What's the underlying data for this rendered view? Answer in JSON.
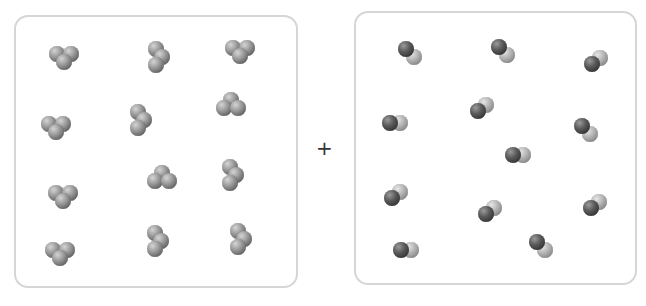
{
  "operator": "+",
  "left_box": {
    "label": "triatomic molecules (3 identical atoms)",
    "count": 12,
    "molecules": [
      {
        "x": 64,
        "y": 57,
        "shape": "v-down"
      },
      {
        "x": 158,
        "y": 57,
        "shape": "v-vertical"
      },
      {
        "x": 240,
        "y": 51,
        "shape": "v-down"
      },
      {
        "x": 56,
        "y": 127,
        "shape": "v-down"
      },
      {
        "x": 140,
        "y": 120,
        "shape": "v-vertical"
      },
      {
        "x": 231,
        "y": 105,
        "shape": "v-up"
      },
      {
        "x": 63,
        "y": 196,
        "shape": "v-down"
      },
      {
        "x": 162,
        "y": 178,
        "shape": "v-up"
      },
      {
        "x": 232,
        "y": 175,
        "shape": "v-vertical"
      },
      {
        "x": 60,
        "y": 253,
        "shape": "v-down"
      },
      {
        "x": 157,
        "y": 241,
        "shape": "v-vertical"
      },
      {
        "x": 240,
        "y": 239,
        "shape": "v-vertical"
      }
    ]
  },
  "right_box": {
    "label": "diatomic molecules (one dark, one light atom)",
    "count": 12,
    "molecules": [
      {
        "x": 410,
        "y": 53,
        "angle": 45
      },
      {
        "x": 503,
        "y": 51,
        "angle": 45
      },
      {
        "x": 596,
        "y": 61,
        "angle": -40
      },
      {
        "x": 395,
        "y": 123,
        "angle": 0
      },
      {
        "x": 482,
        "y": 108,
        "angle": -40
      },
      {
        "x": 586,
        "y": 130,
        "angle": 45
      },
      {
        "x": 518,
        "y": 155,
        "angle": 0
      },
      {
        "x": 396,
        "y": 195,
        "angle": -40
      },
      {
        "x": 490,
        "y": 211,
        "angle": -40
      },
      {
        "x": 595,
        "y": 205,
        "angle": -40
      },
      {
        "x": 406,
        "y": 250,
        "angle": 0
      },
      {
        "x": 541,
        "y": 246,
        "angle": 45
      }
    ]
  }
}
